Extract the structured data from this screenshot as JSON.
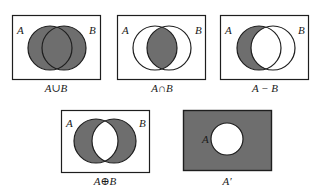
{
  "colors": {
    "shade": "#6e6e6e",
    "stroke": "#1e1e1e",
    "background": "#ffffff"
  },
  "diagrams": [
    {
      "id": "union",
      "caption": "A∪B",
      "set_labels": [
        "A",
        "B"
      ],
      "shaded_region": "A or B"
    },
    {
      "id": "intersection",
      "caption": "A∩B",
      "set_labels": [
        "A",
        "B"
      ],
      "shaded_region": "A and B"
    },
    {
      "id": "difference",
      "caption": "A − B",
      "set_labels": [
        "A",
        "B"
      ],
      "shaded_region": "A but not B"
    },
    {
      "id": "symmetric-difference",
      "caption": "A⊕B",
      "set_labels": [
        "A",
        "B"
      ],
      "shaded_region": "A or B but not both"
    },
    {
      "id": "complement",
      "caption": "A′",
      "set_labels": [
        "A"
      ],
      "shaded_region": "outside A"
    }
  ]
}
